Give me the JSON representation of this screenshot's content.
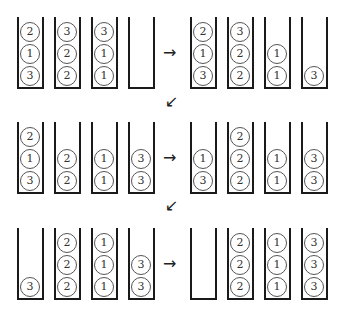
{
  "diagram": {
    "title": "",
    "steps": [
      {
        "name": "row1-left",
        "tubes": [
          [
            3,
            1,
            2
          ],
          [
            2,
            2,
            3
          ],
          [
            1,
            1,
            3
          ],
          []
        ]
      },
      {
        "name": "row1-right",
        "tubes": [
          [
            3,
            1,
            2
          ],
          [
            2,
            2,
            3
          ],
          [
            1,
            1
          ],
          [
            3
          ]
        ]
      },
      {
        "name": "row2-left",
        "tubes": [
          [
            3,
            1,
            2
          ],
          [
            2,
            2
          ],
          [
            1,
            1
          ],
          [
            3,
            3
          ]
        ]
      },
      {
        "name": "row2-right",
        "tubes": [
          [
            3,
            1
          ],
          [
            2,
            2,
            2
          ],
          [
            1,
            1
          ],
          [
            3,
            3
          ]
        ]
      },
      {
        "name": "row3-left",
        "tubes": [
          [
            3
          ],
          [
            2,
            2,
            2
          ],
          [
            1,
            1,
            1
          ],
          [
            3,
            3
          ]
        ]
      },
      {
        "name": "row3-right",
        "tubes": [
          [],
          [
            2,
            2,
            2
          ],
          [
            1,
            1,
            1
          ],
          [
            3,
            3,
            3
          ]
        ]
      }
    ],
    "arrows": {
      "right": "→",
      "down_left": "↙"
    }
  }
}
